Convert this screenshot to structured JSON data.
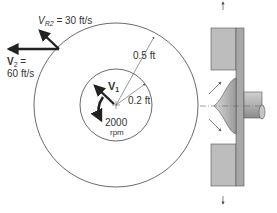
{
  "labels": {
    "vr2_main": "V",
    "vr2_sub": "R2",
    "vr2_value": " = 30 ft/s",
    "v2_main": "V",
    "v2_sub": "2",
    "v2_eq": " =",
    "v2_value": "60 ft/s",
    "v1_main": "V",
    "v1_sub": "1",
    "outer_radius": "0.5 ft",
    "inner_radius": "0.2 ft",
    "speed_value": "2000",
    "speed_unit": "rpm"
  },
  "geometry": {
    "center": [
      116,
      105
    ],
    "outer_radius_px": 82,
    "inner_radius_px": 36
  },
  "colors": {
    "line": "#444444",
    "arrow": "#222222",
    "impeller_fill": "#b5b5b5",
    "impeller_dark": "#8f8f8f",
    "text": "#333333"
  }
}
